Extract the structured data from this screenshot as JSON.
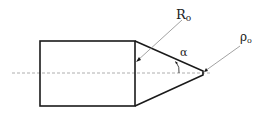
{
  "diagram": {
    "labels": {
      "R": "R",
      "R_sub": "o",
      "rho": "ρ",
      "rho_sub": "o",
      "alpha": "α"
    },
    "colors": {
      "stroke": "#1a1a1a",
      "leader": "#8a8a8a",
      "centerline": "#9a9a9a",
      "background": "#ffffff"
    }
  }
}
